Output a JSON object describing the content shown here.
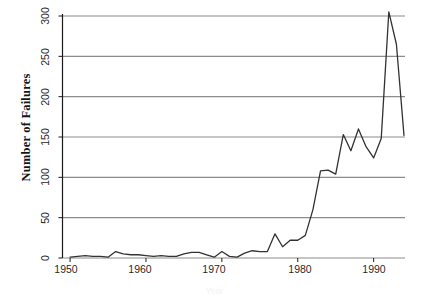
{
  "chart_data": {
    "type": "line",
    "title": "",
    "subtitle": "",
    "xlabel": "Year",
    "ylabel": "Number of Failures",
    "xlim": [
      1949,
      1994
    ],
    "ylim": [
      0,
      310
    ],
    "grid": "horizontal",
    "legend": "none",
    "line_color": "#333333",
    "grid_color": "#8c8c8c",
    "axis_color": "#1a1a1a",
    "background": "#ffffff",
    "x_ticks": [
      1950,
      1960,
      1970,
      1980,
      1990
    ],
    "y_ticks": [
      0,
      50,
      100,
      150,
      200,
      250,
      300
    ],
    "x_tick_labels": [
      "1950",
      "1960",
      "1970",
      "1980",
      "1990"
    ],
    "y_tick_labels": [
      "0",
      "50",
      "100",
      "150",
      "200",
      "250",
      "300"
    ],
    "series": [
      {
        "name": "Number of Failures",
        "x": [
          1950,
          1951,
          1952,
          1953,
          1954,
          1955,
          1956,
          1957,
          1958,
          1959,
          1960,
          1961,
          1962,
          1963,
          1964,
          1965,
          1966,
          1967,
          1968,
          1969,
          1970,
          1971,
          1972,
          1973,
          1974,
          1975,
          1976,
          1977,
          1978,
          1979,
          1980,
          1981,
          1982,
          1983,
          1984,
          1985,
          1986,
          1987,
          1988,
          1989,
          1990,
          1991,
          1992,
          1993,
          1994
        ],
        "values": [
          1,
          2,
          3,
          2,
          2,
          1,
          8,
          5,
          4,
          4,
          3,
          2,
          3,
          2,
          2,
          5,
          7,
          7,
          4,
          1,
          8,
          2,
          1,
          6,
          9,
          8,
          8,
          30,
          14,
          22,
          22,
          28,
          60,
          108,
          109,
          104,
          153,
          133,
          160,
          138,
          124,
          148,
          305,
          265,
          152
        ]
      }
    ],
    "annotations": {
      "peak_year": 1992,
      "peak_value": 305
    }
  },
  "axis": {
    "y_title": "Number of Failures",
    "x_title": "Year"
  }
}
